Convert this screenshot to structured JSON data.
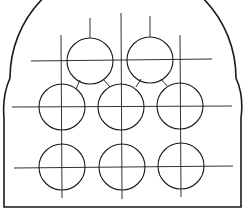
{
  "diagram": {
    "title": "",
    "stroke_color": "#1a1a1a",
    "background_color": "#ffffff",
    "rows": [
      {
        "name": "top-row",
        "count": 2
      },
      {
        "name": "middle-row",
        "count": 3
      },
      {
        "name": "bottom-row",
        "count": 3
      }
    ],
    "total_circles": 8
  }
}
